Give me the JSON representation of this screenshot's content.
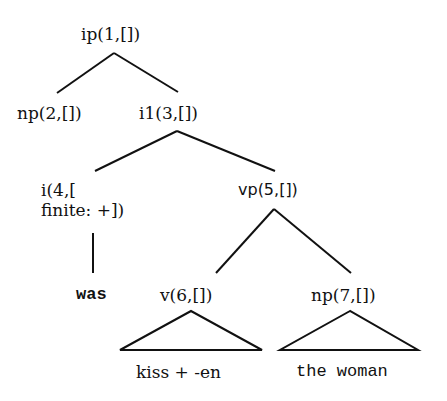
{
  "diagram": {
    "type": "syntax-tree",
    "nodes": [
      {
        "id": 1,
        "label": "ip(1,[])"
      },
      {
        "id": 2,
        "label": "np(2,[])"
      },
      {
        "id": 3,
        "label": "i1(3,[])"
      },
      {
        "id": 4,
        "label_line1": "i(4,[",
        "label_line2": "finite: +])"
      },
      {
        "id": 5,
        "label": "vp(5,[])"
      },
      {
        "id": 6,
        "label": "v(6,[])"
      },
      {
        "id": 7,
        "label": "np(7,[])"
      }
    ],
    "leaves": [
      {
        "parent": 4,
        "text": "was",
        "style": "line"
      },
      {
        "parent": 6,
        "text": "kiss + -en",
        "style": "triangle"
      },
      {
        "parent": 7,
        "text": "the woman",
        "style": "triangle"
      }
    ],
    "edges": [
      [
        1,
        2
      ],
      [
        1,
        3
      ],
      [
        3,
        4
      ],
      [
        3,
        5
      ],
      [
        5,
        6
      ],
      [
        5,
        7
      ]
    ],
    "colors": {
      "line": "#111111",
      "text": "#111111",
      "background": "#ffffff"
    }
  }
}
